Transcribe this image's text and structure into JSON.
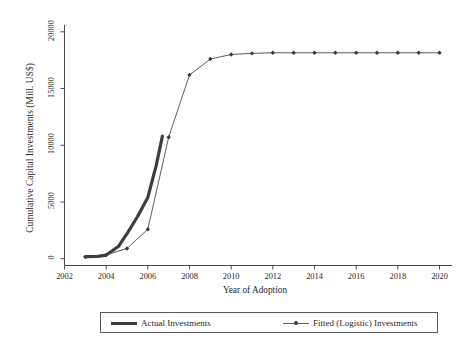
{
  "chart_data": {
    "type": "line",
    "title": "",
    "xlabel": "Year of Adoption",
    "ylabel": "Cumulative Capital Investments (Mill. US$)",
    "xlim": [
      2002,
      2020.6
    ],
    "ylim": [
      -600,
      20600
    ],
    "xticks": [
      2002,
      2004,
      2006,
      2008,
      2010,
      2012,
      2014,
      2016,
      2018,
      2020
    ],
    "xtick_labels": [
      "2002",
      "2004",
      "2006",
      "2008",
      "2010",
      "2012",
      "2014",
      "2016",
      "2018",
      "2020"
    ],
    "yticks": [
      0,
      5000,
      10000,
      15000,
      20000
    ],
    "ytick_labels": [
      "0",
      "5000",
      "10000",
      "15000",
      "20000"
    ],
    "grid": false,
    "legend_position": "below-axes",
    "series": [
      {
        "name": "Actual Investments",
        "style": "thick-line",
        "color": "#3d3d3d",
        "marker": "none",
        "x": [
          2003.0,
          2003.6,
          2004.0,
          2004.6,
          2005.0,
          2005.5,
          2006.0,
          2006.4,
          2006.7
        ],
        "values": [
          180,
          200,
          320,
          1100,
          2200,
          3700,
          5400,
          8200,
          10800
        ]
      },
      {
        "name": "Fitted (Logistic) Investments",
        "style": "thin-line-with-markers",
        "color": "#4a4a4a",
        "marker": "diamond",
        "x": [
          2003,
          2004,
          2005,
          2006,
          2007,
          2008,
          2009,
          2010,
          2011,
          2012,
          2013,
          2014,
          2015,
          2016,
          2017,
          2018,
          2019,
          2020
        ],
        "values": [
          150,
          330,
          900,
          2600,
          10700,
          16200,
          17600,
          18000,
          18100,
          18150,
          18150,
          18150,
          18150,
          18150,
          18150,
          18150,
          18150,
          18150
        ]
      }
    ]
  },
  "legend": {
    "entries": [
      {
        "label": "Actual Investments"
      },
      {
        "label": "Fitted (Logistic) Investments"
      }
    ]
  }
}
